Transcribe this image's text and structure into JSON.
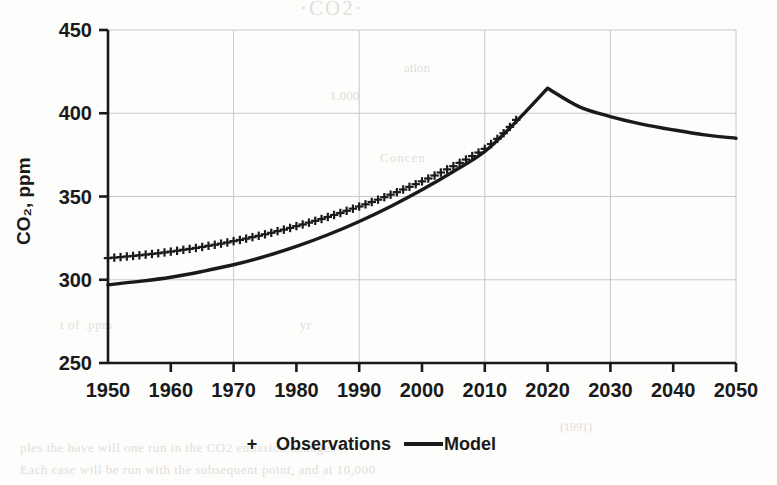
{
  "chart_data": {
    "type": "line",
    "title": "",
    "xlabel": "",
    "ylabel": "CO₂, ppm",
    "xlim": [
      1950,
      2050
    ],
    "ylim": [
      250,
      450
    ],
    "xticks": [
      1950,
      1960,
      1970,
      1980,
      1990,
      2000,
      2010,
      2020,
      2030,
      2040,
      2050
    ],
    "yticks": [
      250,
      300,
      350,
      400,
      450
    ],
    "xtick_labels": [
      "1950",
      "1960",
      "1970",
      "1980",
      "1990",
      "2000",
      "2010",
      "2020",
      "2030",
      "2040",
      "2050"
    ],
    "ytick_labels": [
      "250",
      "300",
      "350",
      "400",
      "450"
    ],
    "grid": "both-faint",
    "legend_position": "bottom-center",
    "series": [
      {
        "name": "Observations",
        "marker": "+",
        "style": "markers",
        "x": [
          1950,
          1951,
          1952,
          1953,
          1954,
          1955,
          1956,
          1957,
          1958,
          1959,
          1960,
          1961,
          1962,
          1963,
          1964,
          1965,
          1966,
          1967,
          1968,
          1969,
          1970,
          1971,
          1972,
          1973,
          1974,
          1975,
          1976,
          1977,
          1978,
          1979,
          1980,
          1981,
          1982,
          1983,
          1984,
          1985,
          1986,
          1987,
          1988,
          1989,
          1990,
          1991,
          1992,
          1993,
          1994,
          1995,
          1996,
          1997,
          1998,
          1999,
          2000,
          2001,
          2002,
          2003,
          2004,
          2005,
          2006,
          2007,
          2008,
          2009,
          2010,
          2011,
          2012,
          2013,
          2014,
          2015
        ],
        "values": [
          313.0,
          313.3,
          313.6,
          314.0,
          314.3,
          314.7,
          315.1,
          315.5,
          315.9,
          316.4,
          316.9,
          317.4,
          318.0,
          318.5,
          319.1,
          319.7,
          320.4,
          321.0,
          321.7,
          322.4,
          323.2,
          323.9,
          324.7,
          325.6,
          326.4,
          327.3,
          328.2,
          329.2,
          330.1,
          331.1,
          332.2,
          333.2,
          334.3,
          335.4,
          336.5,
          337.7,
          338.9,
          340.1,
          341.4,
          342.7,
          344.0,
          345.3,
          346.7,
          348.1,
          349.6,
          351.1,
          352.6,
          354.2,
          355.8,
          357.4,
          359.1,
          360.8,
          362.6,
          364.4,
          366.3,
          368.2,
          370.2,
          372.2,
          374.3,
          376.4,
          378.6,
          381.5,
          384.6,
          388.0,
          391.8,
          396.0
        ]
      },
      {
        "name": "Model",
        "marker": "none",
        "style": "line",
        "x": [
          1950,
          1955,
          1960,
          1965,
          1970,
          1975,
          1980,
          1985,
          1990,
          1995,
          2000,
          2005,
          2010,
          2015,
          2020,
          2025,
          2030,
          2035,
          2040,
          2045,
          2050
        ],
        "values": [
          297.0,
          299.0,
          301.5,
          305.0,
          309.0,
          314.0,
          320.0,
          327.0,
          335.0,
          344.0,
          354.0,
          365.0,
          377.0,
          395.0,
          415.0,
          404.0,
          398.0,
          393.5,
          390.0,
          387.0,
          385.0
        ]
      }
    ],
    "annotations": {
      "model_peak_year": 2020,
      "model_peak_value": 415,
      "observations_start_value": 313,
      "observations_end_value": 396,
      "model_start_value": 297,
      "model_end_value": 385
    },
    "colors": {
      "series_line": "#1a1a1a",
      "series_markers": "#1a1a1a",
      "grid": "#c8c8c8",
      "axis": "#1a1a1a",
      "background": "#fdfdfc"
    }
  },
  "legend": {
    "observations_marker": "+",
    "observations_label": "Observations",
    "model_marker": "—",
    "model_label": "Model"
  },
  "axis": {
    "y_title": "CO₂, ppm"
  },
  "scan_artifacts": {
    "ghost_1": "·CO2·",
    "ghost_2": "ation",
    "ghost_3": "1.000",
    "ghost_4": "Concen",
    "ghost_5": "t of .ppm",
    "ghost_6": "yr",
    "ghost_7": "ples the have will one run in the CO2 emission changes",
    "ghost_8": "Each case will be run with the subsequent point, and at 10,000",
    "ghost_9": "(1991)"
  }
}
